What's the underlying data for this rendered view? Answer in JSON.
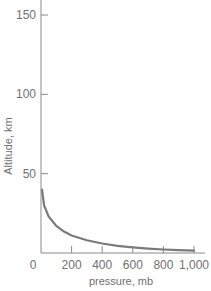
{
  "chart_data": {
    "type": "line",
    "title": "",
    "xlabel": "pressure, mb",
    "ylabel": "Altitude, km",
    "xlim": [
      0,
      1000
    ],
    "ylim": [
      0,
      150
    ],
    "x_ticks": [
      "0",
      "200",
      "400",
      "600",
      "800",
      "1,000"
    ],
    "y_ticks": [
      "50",
      "100",
      "150"
    ],
    "grid": false,
    "legend": null,
    "series": [
      {
        "name": "pressure vs altitude",
        "color": "#7a7a7a",
        "x": [
          0,
          20,
          50,
          100,
          150,
          200,
          300,
          400,
          500,
          600,
          700,
          800,
          900,
          1000
        ],
        "y": [
          40,
          30,
          23,
          17,
          13.5,
          11,
          8,
          6,
          4.5,
          3.5,
          2.8,
          2.2,
          1.8,
          1.5
        ]
      }
    ]
  }
}
